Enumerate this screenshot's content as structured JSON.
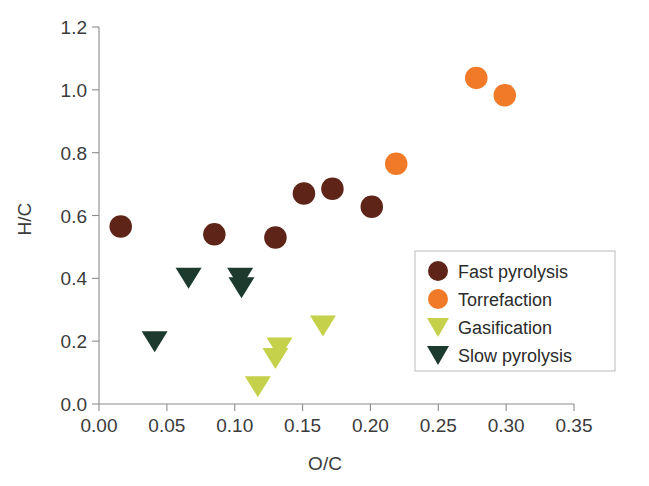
{
  "chart_data": {
    "type": "scatter",
    "title": "",
    "xlabel": "O/C",
    "ylabel": "H/C",
    "xlim": [
      0.0,
      0.35
    ],
    "ylim": [
      0.0,
      1.2
    ],
    "xticks": [
      "0.00",
      "0.05",
      "0.10",
      "0.15",
      "0.20",
      "0.25",
      "0.30",
      "0.35"
    ],
    "yticks": [
      "0.0",
      "0.2",
      "0.4",
      "0.6",
      "0.8",
      "1.0",
      "1.2"
    ],
    "xtick_values": [
      0.0,
      0.05,
      0.1,
      0.15,
      0.2,
      0.25,
      0.3,
      0.35
    ],
    "ytick_values": [
      0.0,
      0.2,
      0.4,
      0.6,
      0.8,
      1.0,
      1.2
    ],
    "grid": false,
    "legend_position": "center-right",
    "series": [
      {
        "name": "Fast pyrolysis",
        "marker": "circle",
        "color": "#5E2418",
        "points": [
          {
            "x": 0.016,
            "y": 0.565
          },
          {
            "x": 0.085,
            "y": 0.54
          },
          {
            "x": 0.13,
            "y": 0.53
          },
          {
            "x": 0.151,
            "y": 0.67
          },
          {
            "x": 0.172,
            "y": 0.685
          },
          {
            "x": 0.201,
            "y": 0.628
          }
        ]
      },
      {
        "name": "Torrefaction",
        "marker": "circle",
        "color": "#F07A28",
        "points": [
          {
            "x": 0.219,
            "y": 0.765
          },
          {
            "x": 0.278,
            "y": 1.038
          },
          {
            "x": 0.299,
            "y": 0.983
          }
        ]
      },
      {
        "name": "Gasification",
        "marker": "triangle-down",
        "color": "#C6D14B",
        "points": [
          {
            "x": 0.117,
            "y": 0.055
          },
          {
            "x": 0.13,
            "y": 0.145
          },
          {
            "x": 0.133,
            "y": 0.178
          },
          {
            "x": 0.165,
            "y": 0.248
          }
        ]
      },
      {
        "name": "Slow pyrolysis",
        "marker": "triangle-down",
        "color": "#1C3A2D",
        "points": [
          {
            "x": 0.041,
            "y": 0.198
          },
          {
            "x": 0.066,
            "y": 0.4
          },
          {
            "x": 0.104,
            "y": 0.4
          },
          {
            "x": 0.105,
            "y": 0.37
          }
        ]
      }
    ]
  },
  "legend": {
    "entries": [
      {
        "label": "Fast pyrolysis",
        "marker": "circle",
        "color": "#5E2418"
      },
      {
        "label": "Torrefaction",
        "marker": "circle",
        "color": "#F07A28"
      },
      {
        "label": "Gasification",
        "marker": "triangle-down",
        "color": "#C6D14B"
      },
      {
        "label": "Slow pyrolysis",
        "marker": "triangle-down",
        "color": "#1C3A2D"
      }
    ]
  },
  "axes": {
    "x_title": "O/C",
    "y_title": "H/C"
  }
}
